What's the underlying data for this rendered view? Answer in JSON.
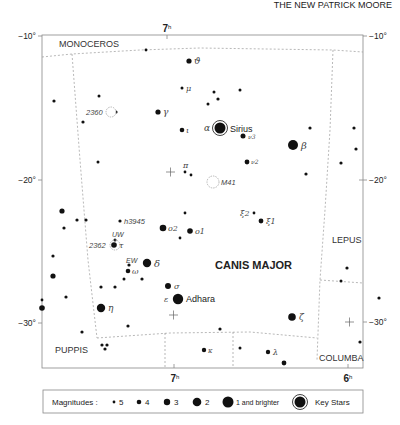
{
  "header": {
    "text": "THE NEW PATRICK MOORE"
  },
  "axes": {
    "ra_top": {
      "label": "7",
      "unit": "h"
    },
    "ra_bottom": [
      {
        "label": "7",
        "unit": "h"
      },
      {
        "label": "6",
        "unit": "h"
      }
    ],
    "dec_left": [
      "−10°",
      "−20°",
      "−30°"
    ],
    "dec_right": [
      "−10°",
      "−20°",
      "−30°"
    ]
  },
  "constellations": {
    "main": "CANIS MAJOR",
    "neighbors": [
      "MONOCEROS",
      "LEPUS",
      "PUPPIS",
      "COLUMBA"
    ]
  },
  "named_stars": [
    {
      "name": "Sirius",
      "greek": "α"
    },
    {
      "name": "Adhara",
      "greek": "ε"
    }
  ],
  "labels": {
    "theta": "ϑ",
    "mu": "μ",
    "gamma": "γ",
    "iota": "ι",
    "alpha": "α",
    "sirius": "Sirius",
    "nu3": "ν3",
    "nu2": "ν2",
    "beta": "β",
    "pi": "π",
    "m41": "M41",
    "xi2": "ξ2",
    "xi1": "ξ1",
    "o2": "o2",
    "o1": "o1",
    "h3945": "h3945",
    "uw": "UW",
    "ngc2362": "2362",
    "tau": "τ",
    "ew": "EW",
    "delta": "δ",
    "omega": "ω",
    "sigma": "σ",
    "epsilon": "ε",
    "adhara": "Adhara",
    "eta": "η",
    "zeta": "ζ",
    "kappa": "κ",
    "lambda": "λ",
    "ngc2360": "2360"
  },
  "legend": {
    "title": "Magnitudes :",
    "items": [
      {
        "label": "5",
        "size": 1.5
      },
      {
        "label": "4",
        "size": 2.3
      },
      {
        "label": "3",
        "size": 3.2
      },
      {
        "label": "2",
        "size": 4.3
      },
      {
        "label": "1 and brighter",
        "size": 5.5
      },
      {
        "label": "Key Stars",
        "size": 5.5
      }
    ]
  },
  "colors": {
    "ink": "#111111",
    "frame": "#888888",
    "boundary": "#999999"
  },
  "stars": [
    [
      146,
      50,
      1.4
    ],
    [
      189,
      61,
      2.6
    ],
    [
      182,
      88,
      1.5
    ],
    [
      214,
      92,
      1.5
    ],
    [
      218,
      99,
      1.6
    ],
    [
      208,
      104,
      1.5
    ],
    [
      240,
      90,
      1.5
    ],
    [
      54,
      101,
      1.6
    ],
    [
      99,
      96,
      1.5
    ],
    [
      116,
      112,
      1.6
    ],
    [
      158,
      112,
      2.6
    ],
    [
      83,
      122,
      1.6
    ],
    [
      182,
      130,
      2.3
    ],
    [
      220,
      128,
      5.5
    ],
    [
      243,
      136,
      2.5
    ],
    [
      247,
      162,
      2.4
    ],
    [
      293,
      145,
      5.0
    ],
    [
      310,
      128,
      1.6
    ],
    [
      354,
      128,
      1.6
    ],
    [
      341,
      163,
      1.6
    ],
    [
      356,
      149,
      1.6
    ],
    [
      306,
      174,
      1.6
    ],
    [
      98,
      162,
      1.5
    ],
    [
      185,
      172,
      1.4
    ],
    [
      191,
      175,
      1.4
    ],
    [
      254,
      213,
      1.4
    ],
    [
      261,
      221,
      2.4
    ],
    [
      62,
      211,
      2.6
    ],
    [
      77,
      220,
      1.6
    ],
    [
      86,
      220,
      1.6
    ],
    [
      64,
      228,
      1.6
    ],
    [
      185,
      213,
      1.4
    ],
    [
      120,
      221,
      1.6
    ],
    [
      163,
      228,
      3.3
    ],
    [
      190,
      231,
      2.8
    ],
    [
      180,
      238,
      1.4
    ],
    [
      115,
      240,
      1.5
    ],
    [
      114,
      245,
      2.8
    ],
    [
      53,
      256,
      1.6
    ],
    [
      53,
      276,
      2.6
    ],
    [
      42,
      300,
      1.4
    ],
    [
      42,
      308,
      2.8
    ],
    [
      66,
      297,
      1.6
    ],
    [
      129,
      265,
      1.6
    ],
    [
      147,
      263,
      4.2
    ],
    [
      128,
      271,
      2.3
    ],
    [
      115,
      287,
      1.6
    ],
    [
      101,
      287,
      1.6
    ],
    [
      124,
      279,
      1.5
    ],
    [
      142,
      279,
      1.6
    ],
    [
      168,
      286,
      3.0
    ],
    [
      178,
      299,
      5.2
    ],
    [
      101,
      308,
      4.2
    ],
    [
      128,
      326,
      1.6
    ],
    [
      82,
      332,
      1.6
    ],
    [
      102,
      345,
      1.6
    ],
    [
      107,
      345,
      1.6
    ],
    [
      105,
      349,
      1.6
    ],
    [
      220,
      329,
      1.6
    ],
    [
      204,
      350,
      2.2
    ],
    [
      240,
      348,
      1.5
    ],
    [
      268,
      352,
      2.2
    ],
    [
      284,
      363,
      2.4
    ],
    [
      292,
      317,
      3.8
    ],
    [
      347,
      268,
      1.6
    ],
    [
      360,
      342,
      1.6
    ],
    [
      341,
      281,
      1.5
    ],
    [
      379,
      298,
      1.6
    ]
  ]
}
